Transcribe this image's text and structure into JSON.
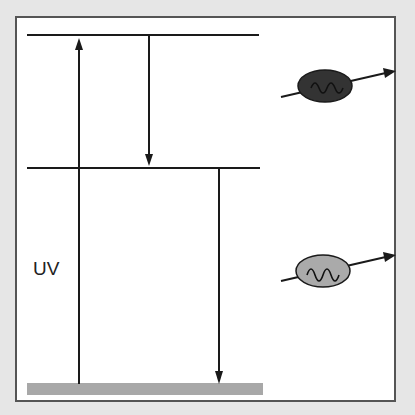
{
  "diagram": {
    "type": "energy-level (Jablonski-style) diagram",
    "label_uv": "UV",
    "levels": [
      {
        "name": "upper-excited-level",
        "y": 35
      },
      {
        "name": "lower-excited-level",
        "y": 168
      },
      {
        "name": "ground-state",
        "y": 388
      }
    ],
    "arrows": [
      {
        "name": "uv-absorption-arrow",
        "direction": "up",
        "from": "ground-state",
        "to": "upper-excited-level"
      },
      {
        "name": "internal-relaxation-arrow",
        "direction": "down",
        "from": "upper-excited-level",
        "to": "lower-excited-level"
      },
      {
        "name": "emission-arrow",
        "direction": "down",
        "from": "lower-excited-level",
        "to": "ground-state"
      }
    ],
    "photons": [
      {
        "name": "dark-photon-particle",
        "fill": "#333333"
      },
      {
        "name": "light-photon-particle",
        "fill": "#aaaaaa"
      }
    ],
    "colors": {
      "background": "#e6e6e6",
      "panel": "#ffffff",
      "line": "#1a1a1a",
      "ground_bar": "#a8a8a8"
    }
  }
}
